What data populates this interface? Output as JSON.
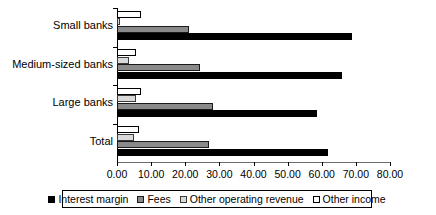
{
  "chart_data": {
    "type": "bar",
    "orientation": "horizontal",
    "title": "",
    "xlabel": "",
    "ylabel": "",
    "xlim": [
      0.0,
      80.0
    ],
    "xtick_step": 10.0,
    "xticks": [
      "0.00",
      "10.00",
      "20.00",
      "30.00",
      "40.00",
      "50.00",
      "60.00",
      "70.00",
      "80.00"
    ],
    "grid": false,
    "legend_position": "bottom",
    "categories": [
      "Small banks",
      "Medium-sized banks",
      "Large banks",
      "Total"
    ],
    "series": [
      {
        "name": "Interest margin",
        "color": "#000000",
        "values": [
          69.0,
          66.0,
          58.5,
          61.8
        ]
      },
      {
        "name": "Fees",
        "color": "#8a8a8a",
        "values": [
          21.0,
          24.3,
          28.0,
          27.0
        ]
      },
      {
        "name": "Other operating revenue",
        "color": "#d9d9d9",
        "values": [
          1.0,
          3.5,
          5.5,
          5.0
        ]
      },
      {
        "name": "Other income",
        "color": "#ffffff",
        "values": [
          7.0,
          5.5,
          7.0,
          6.5
        ]
      }
    ]
  },
  "legend": {
    "items": [
      {
        "label": "Interest margin"
      },
      {
        "label": "Fees"
      },
      {
        "label": "Other operating revenue"
      },
      {
        "label": "Other income"
      }
    ]
  }
}
